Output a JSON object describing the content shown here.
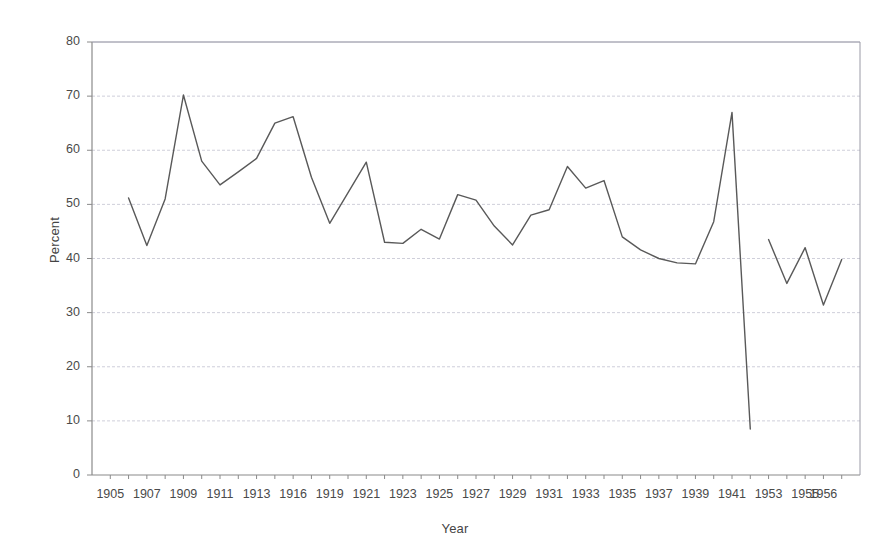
{
  "chart_data": {
    "type": "line",
    "title": "",
    "xlabel": "Year",
    "ylabel": "Percent",
    "ylim": [
      0,
      80
    ],
    "y_ticks": [
      0,
      10,
      20,
      30,
      40,
      50,
      60,
      70,
      80
    ],
    "grid": true,
    "legend": "none",
    "line_color": "#595959",
    "note": "Single series plotted against a categorical year axis; years 1914-1915, 1917-1918, and 1942-1952 are absent from the axis, and the series is broken between 1942 and 1953.",
    "x_tick_labels": [
      "1905",
      "1907",
      "1909",
      "1911",
      "1913",
      "1916",
      "1919",
      "1921",
      "1923",
      "1925",
      "1927",
      "1929",
      "1931",
      "1933",
      "1935",
      "1937",
      "1939",
      "1941",
      "1953",
      "1955",
      "1956"
    ],
    "categories": [
      "1905",
      "1906",
      "1907",
      "1908",
      "1909",
      "1910",
      "1911",
      "1912",
      "1913",
      "1916",
      "1919",
      "1920",
      "1921",
      "1922",
      "1923",
      "1924",
      "1925",
      "1926",
      "1927",
      "1928",
      "1929",
      "1930",
      "1931",
      "1932",
      "1933",
      "1934",
      "1935",
      "1936",
      "1937",
      "1938",
      "1939",
      "1940",
      "1941",
      "1942",
      "1953",
      "1954",
      "1955",
      "1956"
    ],
    "series": [
      {
        "name": "Percent",
        "points": [
          {
            "x": "1906",
            "y": 51.2
          },
          {
            "x": "1907",
            "y": 42.4
          },
          {
            "x": "1908",
            "y": 51.0
          },
          {
            "x": "1909",
            "y": 70.2
          },
          {
            "x": "1910",
            "y": 58.0
          },
          {
            "x": "1911",
            "y": 53.6
          },
          {
            "x": "1912",
            "y": 56.0
          },
          {
            "x": "1913",
            "y": 58.5
          },
          {
            "x": "1914",
            "y": 65.0
          },
          {
            "x": "1916",
            "y": 66.2
          },
          {
            "x": "1918",
            "y": 55.0
          },
          {
            "x": "1919",
            "y": 46.5
          },
          {
            "x": "1921",
            "y": 57.8
          },
          {
            "x": "1922",
            "y": 43.0
          },
          {
            "x": "1923",
            "y": 42.8
          },
          {
            "x": "1924",
            "y": 45.4
          },
          {
            "x": "1925",
            "y": 43.6
          },
          {
            "x": "1926",
            "y": 51.8
          },
          {
            "x": "1927",
            "y": 50.8
          },
          {
            "x": "1928",
            "y": 46.0
          },
          {
            "x": "1929",
            "y": 42.5
          },
          {
            "x": "1930",
            "y": 48.0
          },
          {
            "x": "1931",
            "y": 49.0
          },
          {
            "x": "1932",
            "y": 57.0
          },
          {
            "x": "1933",
            "y": 53.0
          },
          {
            "x": "1934",
            "y": 54.4
          },
          {
            "x": "1935",
            "y": 44.0
          },
          {
            "x": "1936",
            "y": 41.6
          },
          {
            "x": "1937",
            "y": 40.0
          },
          {
            "x": "1938",
            "y": 39.2
          },
          {
            "x": "1939",
            "y": 39.0
          },
          {
            "x": "1940",
            "y": 46.8
          },
          {
            "x": "1941",
            "y": 67.0
          },
          {
            "x": "1942",
            "y": 8.5
          }
        ]
      },
      {
        "name": "Percent (post-war)",
        "points": [
          {
            "x": "1953",
            "y": 43.5
          },
          {
            "x": "1954",
            "y": 35.4
          },
          {
            "x": "1955",
            "y": 42.0
          },
          {
            "x": "1956",
            "y": 31.4
          },
          {
            "x": "1957",
            "y": 39.8
          }
        ]
      }
    ]
  },
  "axes": {
    "y_title": "Percent",
    "x_title": "Year",
    "y_tick_labels": [
      "80",
      "70",
      "60",
      "50",
      "40",
      "30",
      "20",
      "10",
      "0"
    ],
    "x_tick_labels": [
      "1905",
      "1907",
      "1909",
      "1911",
      "1913",
      "1916",
      "1919",
      "1921",
      "1923",
      "1925",
      "1927",
      "1929",
      "1931",
      "1933",
      "1935",
      "1937",
      "1939",
      "1941",
      "1953",
      "1955",
      "1956"
    ]
  },
  "style": {
    "line_color": "#595959",
    "axis_color": "#8a8a8a",
    "grid_color": "#c9c9d6",
    "text_color": "#4a4a4a",
    "background": "#ffffff"
  }
}
